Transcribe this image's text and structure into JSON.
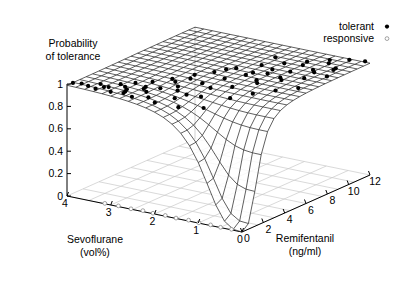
{
  "chart_data": {
    "type": "line",
    "plot_kind": "3d-surface-mesh-with-scatter",
    "title": "",
    "zlabel_lines": [
      "Probability",
      "of tolerance"
    ],
    "xlabel_lines": [
      "Sevoflurane",
      "(vol%)"
    ],
    "ylabel_lines": [
      "Remifentanil",
      "(ng/ml)"
    ],
    "zlabel": "Probability of tolerance",
    "xlabel": "Sevoflurane (vol%)",
    "ylabel": "Remifentanil (ng/ml)",
    "grid": true,
    "legend_position": "top-right",
    "zticks": [
      "0",
      "0.2",
      "0.4",
      "0.6",
      "0.8",
      "1"
    ],
    "ztick_values": [
      0,
      0.2,
      0.4,
      0.6,
      0.8,
      1
    ],
    "zlim": [
      0,
      1
    ],
    "xticks": [
      "4",
      "3",
      "2",
      "1",
      "0"
    ],
    "xtick_values": [
      4,
      3,
      2,
      1,
      0
    ],
    "xlim": [
      0,
      4
    ],
    "yticks": [
      "0",
      "2",
      "4",
      "6",
      "8",
      "10",
      "12"
    ],
    "ytick_values": [
      0,
      2,
      4,
      6,
      8,
      10,
      12
    ],
    "ylim": [
      0,
      12
    ],
    "legend": [
      {
        "label": "tolerant",
        "marker": "filled-circle",
        "color": "#000000"
      },
      {
        "label": "responsive",
        "marker": "open-circle",
        "color": "#ffffff"
      }
    ],
    "surface_model": {
      "description": "Probability of tolerance surface rising with both sevoflurane and remifentanil concentration; steep sigmoid drop toward the zero-zero corner.",
      "c50_sevo": 0.95,
      "c50_remi": 1.55,
      "gamma": 3.1,
      "nx": 21,
      "ny": 21
    },
    "series": [
      {
        "name": "tolerant",
        "marker": "filled-circle",
        "points": [
          [
            3.95,
            0.35
          ],
          [
            3.8,
            0.55
          ],
          [
            3.62,
            0.42
          ],
          [
            3.5,
            1.1
          ],
          [
            3.42,
            0.3
          ],
          [
            3.28,
            0.95
          ],
          [
            3.2,
            1.75
          ],
          [
            3.1,
            0.4
          ],
          [
            3.02,
            2.4
          ],
          [
            2.95,
            1.3
          ],
          [
            2.88,
            0.7
          ],
          [
            2.8,
            3.1
          ],
          [
            2.72,
            1.95
          ],
          [
            2.65,
            0.55
          ],
          [
            2.58,
            4.05
          ],
          [
            2.5,
            2.6
          ],
          [
            2.42,
            1.15
          ],
          [
            2.35,
            5.2
          ],
          [
            2.28,
            3.35
          ],
          [
            2.2,
            0.85
          ],
          [
            2.12,
            6.1
          ],
          [
            2.05,
            2.1
          ],
          [
            1.98,
            4.4
          ],
          [
            1.9,
            7.25
          ],
          [
            1.82,
            1.5
          ],
          [
            1.75,
            5.55
          ],
          [
            1.68,
            3.05
          ],
          [
            1.6,
            8.4
          ],
          [
            1.52,
            6.6
          ],
          [
            1.45,
            2.35
          ],
          [
            1.38,
            4.75
          ],
          [
            1.3,
            9.3
          ],
          [
            1.22,
            7.4
          ],
          [
            1.15,
            3.6
          ],
          [
            1.08,
            5.85
          ],
          [
            1.0,
            10.2
          ],
          [
            0.92,
            8.3
          ],
          [
            0.85,
            4.5
          ],
          [
            0.78,
            6.9
          ],
          [
            0.7,
            11.1
          ],
          [
            0.62,
            9.2
          ],
          [
            0.55,
            5.4
          ],
          [
            0.48,
            7.8
          ],
          [
            0.4,
            11.7
          ],
          [
            0.32,
            10.1
          ],
          [
            0.25,
            6.3
          ],
          [
            0.18,
            8.7
          ],
          [
            0.1,
            11.95
          ],
          [
            2.6,
            1.7
          ],
          [
            2.45,
            3.8
          ],
          [
            1.95,
            2.8
          ],
          [
            1.72,
            4.1
          ],
          [
            1.48,
            7.1
          ],
          [
            1.18,
            6.2
          ],
          [
            0.95,
            9.6
          ],
          [
            0.6,
            10.6
          ],
          [
            3.35,
            0.8
          ],
          [
            3.05,
            1.55
          ],
          [
            2.75,
            2.25
          ],
          [
            2.3,
            4.6
          ],
          [
            2.02,
            6.8
          ],
          [
            1.65,
            9.9
          ],
          [
            1.28,
            8.1
          ],
          [
            0.88,
            7.2
          ],
          [
            0.52,
            8.9
          ],
          [
            0.3,
            9.8
          ],
          [
            2.9,
            0.95
          ],
          [
            2.18,
            2.9
          ]
        ]
      },
      {
        "name": "responsive",
        "marker": "open-circle",
        "points": [
          [
            3.15,
            0.06
          ],
          [
            2.85,
            0.1
          ],
          [
            2.55,
            0.05
          ],
          [
            2.3,
            0.14
          ],
          [
            2.05,
            0.07
          ],
          [
            1.78,
            0.11
          ],
          [
            1.52,
            0.05
          ],
          [
            1.25,
            0.12
          ],
          [
            1.0,
            0.06
          ],
          [
            0.74,
            0.09
          ],
          [
            0.5,
            0.04
          ],
          [
            0.26,
            0.08
          ]
        ]
      }
    ]
  },
  "geometry": {
    "origin_px": [
      242,
      232
    ],
    "x_corner_px": [
      67,
      196
    ],
    "y_corner_px": [
      370,
      175
    ],
    "z_height_px": 112,
    "z_top_px": [
      67,
      84
    ]
  },
  "legend_render": {
    "text_right_x": 374,
    "marker_x": 387,
    "row1_y": 30,
    "row2_y": 42
  },
  "labels": {
    "zlabel_x": 33,
    "zlabel_y1": 47,
    "zlabel_y2": 60,
    "xlabel_x": 95,
    "xlabel_y1": 243,
    "xlabel_y2": 256,
    "ylabel_x": 305,
    "ylabel_y1": 242,
    "ylabel_y2": 255
  }
}
